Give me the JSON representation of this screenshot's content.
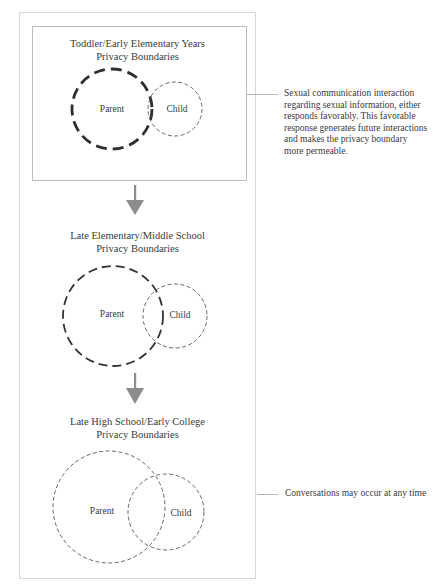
{
  "stages": [
    {
      "title_line1": "Toddler/Early Elementary Years",
      "title_line2": "Privacy Boundaries",
      "parent_label": "Parent",
      "child_label": "Child",
      "parent_boundary": "thick-dashed",
      "child_boundary": "thin-dashed"
    },
    {
      "title_line1": "Late Elementary/Middle School",
      "title_line2": "Privacy Boundaries",
      "parent_label": "Parent",
      "child_label": "Child",
      "parent_boundary": "medium-dashed",
      "child_boundary": "thin-dashed"
    },
    {
      "title_line1": "Late High School/Early College",
      "title_line2": "Privacy Boundaries",
      "parent_label": "Parent",
      "child_label": "Child",
      "parent_boundary": "thin-dashed",
      "child_boundary": "thin-dashed"
    }
  ],
  "notes": {
    "stage1_lines": [
      "Sexual communication interaction",
      "regarding sexual information, either",
      "responds favorably. This favorable",
      "response generates future interactions",
      "and makes the privacy boundary",
      "more permeable."
    ],
    "stage3": "Conversations may occur at any time"
  },
  "icons": {
    "arrow": "down-arrow-icon"
  },
  "colors": {
    "arrow": "#8c8c8c",
    "boundary": "#3a3a3a",
    "frame": "#d6d6d6"
  }
}
